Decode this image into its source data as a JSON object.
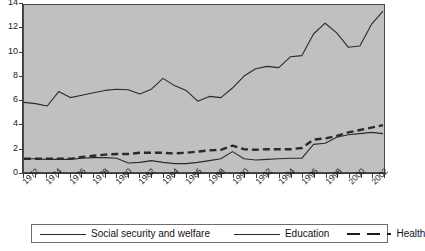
{
  "chart_data": {
    "type": "line",
    "title": "",
    "subtitle": "",
    "xlabel": "",
    "ylabel": "",
    "xlim": [
      1972,
      2003
    ],
    "ylim": [
      0,
      14
    ],
    "ytick_values": [
      0,
      2,
      4,
      6,
      8,
      10,
      12,
      14
    ],
    "ytick_labels": [
      "0",
      "2",
      "4",
      "6",
      "8",
      "10",
      "12",
      "14"
    ],
    "xtick_labels": [
      "1972",
      "1974",
      "1976",
      "1978",
      "1980",
      "1982",
      "1984",
      "1986",
      "1988",
      "1990",
      "1992",
      "1994",
      "1996",
      "1998",
      "2000",
      "2002"
    ],
    "x": [
      1972,
      1973,
      1974,
      1975,
      1976,
      1977,
      1978,
      1979,
      1980,
      1981,
      1982,
      1983,
      1984,
      1985,
      1986,
      1987,
      1988,
      1989,
      1990,
      1991,
      1992,
      1993,
      1994,
      1995,
      1996,
      1997,
      1998,
      1999,
      2000,
      2001,
      2002,
      2003
    ],
    "grid": false,
    "legend_position": "bottom",
    "series": [
      {
        "name": "Social security and welfare",
        "style": "solid-thin",
        "values": [
          5.8,
          5.7,
          5.5,
          6.7,
          6.2,
          6.4,
          6.6,
          6.8,
          6.9,
          6.85,
          6.5,
          6.9,
          7.8,
          7.2,
          6.8,
          5.9,
          6.3,
          6.2,
          7.0,
          8.0,
          8.6,
          8.8,
          8.7,
          9.6,
          9.7,
          11.5,
          12.4,
          11.6,
          10.4,
          10.5,
          12.3,
          13.4
        ]
      },
      {
        "name": "Education",
        "style": "solid-thin",
        "values": [
          1.1,
          1.1,
          1.05,
          1.05,
          1.05,
          1.15,
          1.2,
          1.2,
          1.15,
          0.75,
          0.8,
          0.95,
          0.8,
          0.7,
          0.7,
          0.8,
          0.95,
          1.1,
          1.7,
          1.1,
          1.0,
          1.05,
          1.1,
          1.15,
          1.15,
          2.3,
          2.4,
          2.9,
          3.1,
          3.2,
          3.3,
          3.2
        ]
      },
      {
        "name": "Health",
        "style": "dashed-thick",
        "values": [
          1.1,
          1.1,
          1.1,
          1.1,
          1.1,
          1.25,
          1.35,
          1.45,
          1.5,
          1.5,
          1.6,
          1.6,
          1.6,
          1.55,
          1.6,
          1.7,
          1.8,
          1.85,
          2.2,
          1.9,
          1.85,
          1.9,
          1.9,
          1.9,
          2.0,
          2.7,
          2.8,
          3.0,
          3.3,
          3.5,
          3.7,
          3.9
        ]
      }
    ]
  },
  "legend": {
    "entries": [
      {
        "label": "Social security and welfare",
        "style": "solid"
      },
      {
        "label": "Education",
        "style": "solid"
      },
      {
        "label": "Health",
        "style": "dashed"
      }
    ]
  },
  "colors": {
    "plot_background": "#c0c0c0",
    "page_background": "#ffffff",
    "line": "#2a2a2a",
    "axis": "#3a3a3a",
    "text": "#111111"
  }
}
